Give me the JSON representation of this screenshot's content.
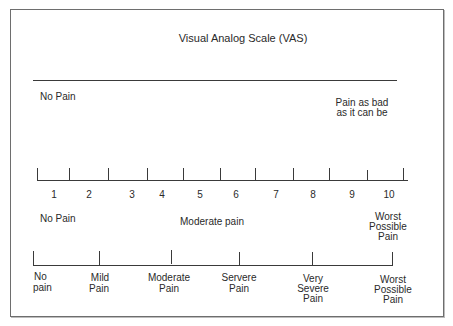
{
  "title": "Visual Analog Scale (VAS)",
  "vas": {
    "left_label": "No Pain",
    "right_label_line1": "Pain as bad",
    "right_label_line2": "as it can be"
  },
  "numeric_scale": {
    "numbers": [
      "1",
      "2",
      "3",
      "4",
      "5",
      "6",
      "7",
      "8",
      "9",
      "10"
    ],
    "left_label": "No Pain",
    "middle_label": "Moderate pain",
    "right_label_line1": "Worst",
    "right_label_line2": "Possible",
    "right_label_line3": "Pain"
  },
  "descriptive_scale": {
    "labels": [
      [
        "No",
        "pain"
      ],
      [
        "Mild",
        "Pain"
      ],
      [
        "Moderate",
        "Pain"
      ],
      [
        "Servere",
        "Pain"
      ],
      [
        "Very",
        "Severe",
        "Pain"
      ],
      [
        "Worst",
        "Possible",
        "Pain"
      ]
    ]
  }
}
